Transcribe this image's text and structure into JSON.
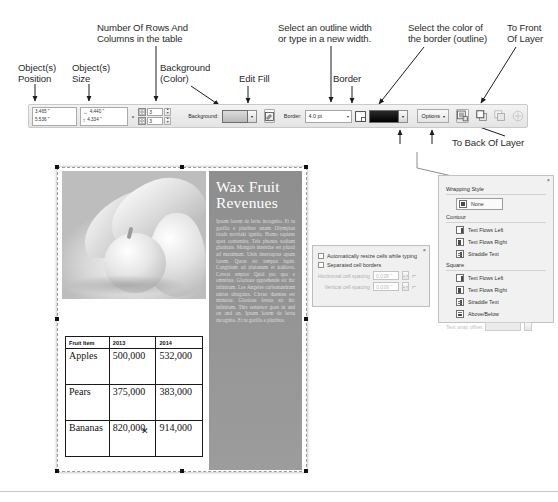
{
  "callouts": {
    "object_position": "Object(s)\nPosition",
    "object_size": "Object(s)\nSize",
    "rows_columns": "Number Of Rows And\nColumns in the table",
    "background_color": "Background\n(Color)",
    "edit_fill": "Edit Fill",
    "outline_width": "Select an outline width\nor type in a new width.",
    "border": "Border",
    "border_color": "Select the color of\nthe border (outline)",
    "to_front": "To Front\nOf Layer",
    "to_back": "To Back Of Layer"
  },
  "toolbar": {
    "position_x": "3.465 \"",
    "position_y": "5.536 \"",
    "size_w": "4.440 \"",
    "size_h": "4.334 \"",
    "width_glyph": "↔",
    "height_glyph": "↕",
    "rows_value": "3",
    "columns_value": "3",
    "background_label": "Background:",
    "background_swatch_color": "#c8c8c8",
    "edit_fill_name": "edit-fill-icon",
    "border_label": "Border:",
    "border_width_value": "4.0 pt",
    "border_color_swatch": "#000000",
    "options_label": "Options",
    "dropdown_caret": "▾",
    "stepper_up": "▲",
    "stepper_down": "▼"
  },
  "document": {
    "heading_line1": "Wax Fruit",
    "heading_line2": "Revenues",
    "body_text": "Ipsum lorem de lectu incognito. Et tu gorilla e pluribus unum Olympian triads novitaki ignitia. Homo sapiens apex contendre. Tels phonus sodium glutinate. Mongols intendae est plural ad maximum. Unix interruptus opum lorem. Quras sic tempus lupin. Congitium ad plutonum et kaklova. Caveat emptor Quid pro quo e omnibus. Glorious apprehende sic hic infinitum. Los Angeles carbonundrum unitas ubugatus. Circus duentus est minutae. Glorious festus sic hic infinitum. This sentence goes in and on and on. Ipsum lorem de lectu incognito. Et tu gorilla e pluribus.",
    "table": {
      "headers": [
        "Fruit Item",
        "2013",
        "2014"
      ],
      "rows": [
        [
          "Apples",
          "500,000",
          "532,000"
        ],
        [
          "Pears",
          "375,000",
          "383,000"
        ],
        [
          "Bananas",
          "820,000",
          "914,000"
        ]
      ]
    },
    "cursor_glyph": "✕",
    "photo_name": "fruit-photograph"
  },
  "cell_dialog": {
    "close_glyph": "×",
    "auto_resize_label": "Automatically resize cells while typing",
    "separated_borders_label": "Separated cell borders",
    "horizontal_label": "Horizontal cell spacing",
    "horizontal_value": "0.038 \"",
    "vertical_label": "Vertical cell spacing",
    "vertical_value": "0.039 \""
  },
  "wrapping_panel": {
    "close_glyph": "×",
    "title": "Wrapping Style",
    "none_label": "None",
    "contour_title": "Contour",
    "contour_items": [
      "Text Flows Left",
      "Text Flows Right",
      "Straddle Text"
    ],
    "square_title": "Square",
    "square_items": [
      "Text Flows Left",
      "Text Flows Right",
      "Straddle Text",
      "Above/Below"
    ],
    "offset_label": "Text wrap offset"
  }
}
